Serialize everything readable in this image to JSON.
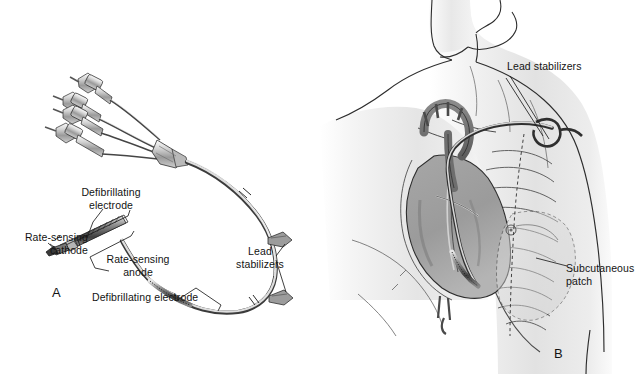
{
  "figure": {
    "background_color": "#ffffff",
    "ink_color": "#131313",
    "width": 635,
    "height": 374
  },
  "panels": [
    {
      "id": "A",
      "marker": "A",
      "caption": "Isolated ICD lead with connector pins, defibrillating electrodes, rate-sensing electrodes and lead stabilizers",
      "labels": [
        {
          "key": "defib_electrode_proximal",
          "text": "Defibrillating\nelectrode",
          "align": "center"
        },
        {
          "key": "rate_sensing_cathode",
          "text": "Rate-sensing\ncathode",
          "align": "right"
        },
        {
          "key": "rate_sensing_anode",
          "text": "Rate-sensing\nanode",
          "align": "center"
        },
        {
          "key": "lead_stabilizers",
          "text": "Lead\nstabilizers",
          "align": "center"
        },
        {
          "key": "defib_electrode_distal",
          "text": "Defibrillating electrode",
          "align": "left"
        }
      ]
    },
    {
      "id": "B",
      "marker": "B",
      "caption": "Anatomic placement in the thorax showing lead course and subcutaneous patch",
      "labels": [
        {
          "key": "lead_stabilizers",
          "text": "Lead stabilizers",
          "align": "left"
        },
        {
          "key": "subcutaneous_patch",
          "text": "Subcutaneous\npatch",
          "align": "left"
        }
      ]
    }
  ],
  "label_text": {
    "defib_electrode_proximal": "Defibrillating\nelectrode",
    "rate_sensing_cathode": "Rate-sensing\ncathode",
    "rate_sensing_anode": "Rate-sensing\nanode",
    "lead_stabilizers_a": "Lead\nstabilizers",
    "defib_electrode_distal": "Defibrillating electrode",
    "lead_stabilizers_b": "Lead stabilizers",
    "subcutaneous_patch": "Subcutaneous\npatch",
    "marker_a": "A",
    "marker_b": "B"
  }
}
